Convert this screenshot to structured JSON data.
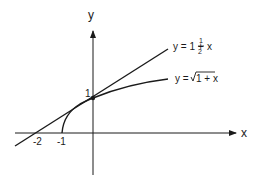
{
  "diagram": {
    "axes": {
      "x_label": "x",
      "y_label": "y",
      "x_ticks": [
        {
          "value": -2,
          "label": "-2"
        },
        {
          "value": -1,
          "label": "-1"
        }
      ],
      "y_ticks": [
        {
          "value": 1,
          "label": "1"
        }
      ]
    },
    "curves": [
      {
        "name": "tangent-line",
        "label_prefix": "y = 1 + ",
        "label_frac_num": "1",
        "label_frac_den": "2",
        "label_suffix": "x",
        "equation": "y = 1 + (1/2)x"
      },
      {
        "name": "sqrt-curve",
        "label_prefix": "y = ",
        "label_radicand": "1 + x",
        "equation": "y = sqrt(1 + x)"
      }
    ],
    "tangent_point": {
      "x": 0,
      "y": 1
    },
    "colors": {
      "stroke": "#1a1a1a",
      "background": "#ffffff"
    }
  }
}
